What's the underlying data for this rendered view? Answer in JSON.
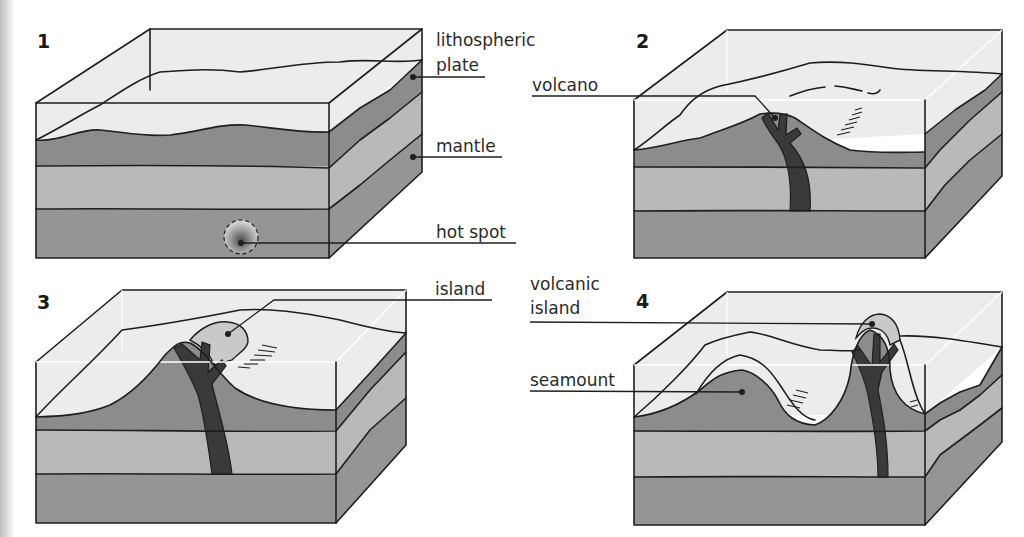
{
  "figure": {
    "colors": {
      "water": "#ececec",
      "lithosphere": "#8c8c8c",
      "upper_mantle": "#b9b9b9",
      "lower_mantle": "#959595",
      "magma": "#3a3a3a",
      "island": "#c9c9c9",
      "outline": "#1e1e1e"
    },
    "panels": [
      {
        "number": "1",
        "labels": {
          "lithospheric_line1": "lithospheric",
          "lithospheric_line2": "plate",
          "mantle": "mantle",
          "hot_spot": "hot spot"
        }
      },
      {
        "number": "2",
        "labels": {
          "volcano": "volcano"
        }
      },
      {
        "number": "3",
        "labels": {
          "island": "island"
        }
      },
      {
        "number": "4",
        "labels": {
          "volcanic_island_line1": "volcanic",
          "volcanic_island_line2": "island",
          "seamount": "seamount"
        }
      }
    ]
  }
}
